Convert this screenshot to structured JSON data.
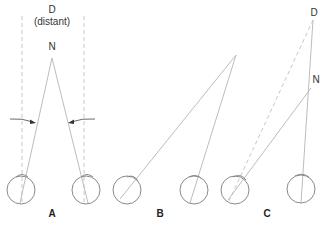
{
  "figure": {
    "panels": [
      {
        "id": "A",
        "label": "A",
        "far_label": "D",
        "far_sublabel": "(distant)",
        "near_label": "N"
      },
      {
        "id": "B",
        "label": "B"
      },
      {
        "id": "C",
        "label": "C",
        "far_label": "D",
        "near_label": "N"
      }
    ],
    "colors": {
      "lines": "#bdbdbd",
      "dashed": "#c8c8c8",
      "eyes": "#8a8a8a",
      "arrows": "#333333",
      "text": "#333333"
    }
  }
}
